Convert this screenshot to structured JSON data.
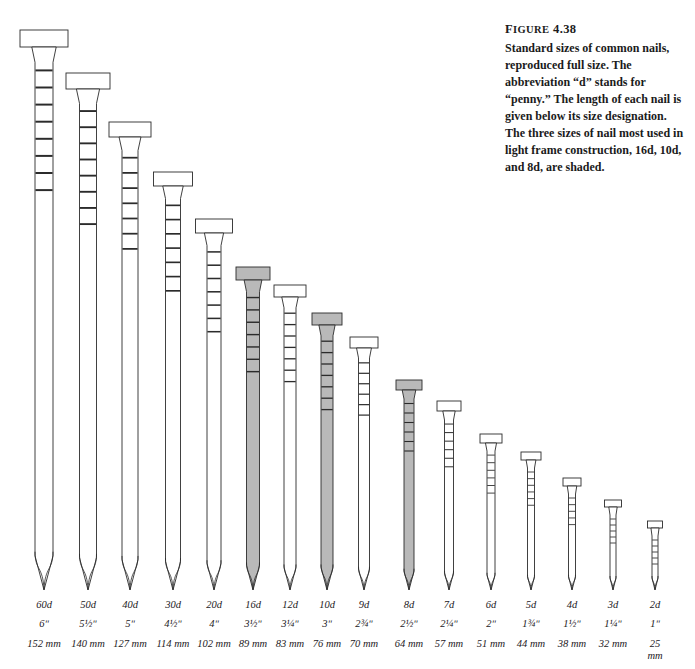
{
  "caption": {
    "figure_label": "FIGURE 4.38",
    "text": "Standard sizes of common nails, reproduced full size. The abbreviation “d” stands for “penny.” The length of each nail is given below its size designation. The three sizes of nail most used in light frame construction, 16d, 10d, and 8d, are shaded."
  },
  "colors": {
    "outline": "#2b2b2b",
    "shaded_fill": "#b9b9b9",
    "plain_fill": "#ffffff",
    "background": "#ffffff",
    "label_text": "#23201d"
  },
  "chart_data": {
    "type": "bar",
    "title": "Standard sizes of common nails",
    "xlabel": "Nail size designation (penny)",
    "ylabel": "Length",
    "units": [
      "in",
      "mm"
    ],
    "legend": [
      "shaded = most used in light frame construction"
    ],
    "categories": [
      "60d",
      "50d",
      "40d",
      "30d",
      "20d",
      "16d",
      "12d",
      "10d",
      "9d",
      "8d",
      "7d",
      "6d",
      "5d",
      "4d",
      "3d",
      "2d"
    ],
    "values_mm": [
      152,
      140,
      127,
      114,
      102,
      89,
      83,
      76,
      70,
      64,
      57,
      51,
      44,
      38,
      32,
      25
    ],
    "values_in": [
      6,
      5.5,
      5,
      4.5,
      4,
      3.5,
      3.25,
      3,
      2.75,
      2.5,
      2.25,
      2,
      1.75,
      1.5,
      1.25,
      1
    ]
  },
  "nails": [
    {
      "size": "60d",
      "inch": "6ʺ",
      "mm": "152 mm",
      "mm_l1": "152 mm",
      "mm_l2": "",
      "shaded": false,
      "cx": 44,
      "top": 30,
      "head_w": 48,
      "head_h": 17,
      "shank_w": 18,
      "tick_count": 8
    },
    {
      "size": "50d",
      "inch": "5½ʺ",
      "mm": "140 mm",
      "mm_l1": "140 mm",
      "mm_l2": "",
      "shaded": false,
      "cx": 88,
      "top": 73,
      "head_w": 44,
      "head_h": 16,
      "shank_w": 17,
      "tick_count": 8
    },
    {
      "size": "40d",
      "inch": "5ʺ",
      "mm": "127 mm",
      "mm_l1": "127 mm",
      "mm_l2": "",
      "shaded": false,
      "cx": 130,
      "top": 122,
      "head_w": 42,
      "head_h": 15,
      "shank_w": 16,
      "tick_count": 7
    },
    {
      "size": "30d",
      "inch": "4½ʺ",
      "mm": "114 mm",
      "mm_l1": "114 mm",
      "mm_l2": "",
      "shaded": false,
      "cx": 173,
      "top": 172,
      "head_w": 39,
      "head_h": 14,
      "shank_w": 15,
      "tick_count": 7
    },
    {
      "size": "20d",
      "inch": "4ʺ",
      "mm": "102 mm",
      "mm_l1": "102 mm",
      "mm_l2": "",
      "shaded": false,
      "cx": 214,
      "top": 219,
      "head_w": 37,
      "head_h": 14,
      "shank_w": 14,
      "tick_count": 7
    },
    {
      "size": "16d",
      "inch": "3½ʺ",
      "mm": "89 mm",
      "mm_l1": "89 mm",
      "mm_l2": "",
      "shaded": true,
      "cx": 253,
      "top": 267,
      "head_w": 34,
      "head_h": 13,
      "shank_w": 13,
      "tick_count": 7
    },
    {
      "size": "12d",
      "inch": "3¼ʺ",
      "mm": "83 mm",
      "mm_l1": "83 mm",
      "mm_l2": "",
      "shaded": false,
      "cx": 290,
      "top": 285,
      "head_w": 32,
      "head_h": 12,
      "shank_w": 12,
      "tick_count": 7
    },
    {
      "size": "10d",
      "inch": "3ʺ",
      "mm": "76 mm",
      "mm_l1": "76 mm",
      "mm_l2": "",
      "shaded": true,
      "cx": 327,
      "top": 313,
      "head_w": 30,
      "head_h": 12,
      "shank_w": 12,
      "tick_count": 7
    },
    {
      "size": "9d",
      "inch": "2¾ʺ",
      "mm": "70 mm",
      "mm_l1": "70 mm",
      "mm_l2": "",
      "shaded": false,
      "cx": 364,
      "top": 337,
      "head_w": 28,
      "head_h": 11,
      "shank_w": 11,
      "tick_count": 6
    },
    {
      "size": "8d",
      "inch": "2½ʺ",
      "mm": "64 mm",
      "mm_l1": "64 mm",
      "mm_l2": "",
      "shaded": true,
      "cx": 409,
      "top": 380,
      "head_w": 26,
      "head_h": 10,
      "shank_w": 10,
      "tick_count": 6
    },
    {
      "size": "7d",
      "inch": "2¼ʺ",
      "mm": "57 mm",
      "mm_l1": "57 mm",
      "mm_l2": "",
      "shaded": false,
      "cx": 449,
      "top": 401,
      "head_w": 24,
      "head_h": 10,
      "shank_w": 9,
      "tick_count": 6
    },
    {
      "size": "6d",
      "inch": "2ʺ",
      "mm": "51 mm",
      "mm_l1": "51 mm",
      "mm_l2": "",
      "shaded": false,
      "cx": 491,
      "top": 434,
      "head_w": 22,
      "head_h": 9,
      "shank_w": 8,
      "tick_count": 6
    },
    {
      "size": "5d",
      "inch": "1¾ʺ",
      "mm": "44 mm",
      "mm_l1": "44 mm",
      "mm_l2": "",
      "shaded": false,
      "cx": 531,
      "top": 452,
      "head_w": 20,
      "head_h": 8,
      "shank_w": 7,
      "tick_count": 6
    },
    {
      "size": "4d",
      "inch": "1½ʺ",
      "mm": "38 mm",
      "mm_l1": "38 mm",
      "mm_l2": "",
      "shaded": false,
      "cx": 572,
      "top": 478,
      "head_w": 18,
      "head_h": 8,
      "shank_w": 7,
      "tick_count": 5
    },
    {
      "size": "3d",
      "inch": "1¼ʺ",
      "mm": "32 mm",
      "mm_l1": "32 mm",
      "mm_l2": "",
      "shaded": false,
      "cx": 613,
      "top": 500,
      "head_w": 17,
      "head_h": 7,
      "shank_w": 6,
      "tick_count": 5
    },
    {
      "size": "2d",
      "inch": "1ʺ",
      "mm": "25 mm",
      "mm_l1": "25",
      "mm_l2": "mm",
      "shaded": false,
      "cx": 655,
      "top": 521,
      "head_w": 15,
      "head_h": 7,
      "shank_w": 6,
      "tick_count": 5
    }
  ],
  "geometry": {
    "baseline": 590,
    "label_row_top": 600
  }
}
